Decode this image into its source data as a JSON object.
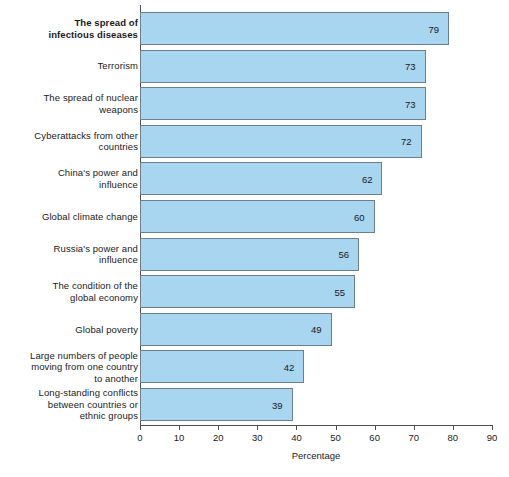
{
  "chart_data": {
    "type": "bar",
    "orientation": "horizontal",
    "title": "",
    "xlabel": "Percentage",
    "ylabel": "",
    "xlim": [
      0,
      90
    ],
    "xticks": [
      0,
      10,
      20,
      30,
      40,
      50,
      60,
      70,
      80,
      90
    ],
    "grid": false,
    "legend": null,
    "bar_fill_color": "#a8d5ef",
    "bar_border_color": "#6e7f8c",
    "categories": [
      "The spread of infectious diseases",
      "Terrorism",
      "The spread of nuclear weapons",
      "Cyberattacks from other countries",
      "China's power and influence",
      "Global climate change",
      "Russia's power and influence",
      "The condition of the global economy",
      "Global poverty",
      "Large numbers of people moving from one country to another",
      "Long-standing conflicts between countries or ethnic groups"
    ],
    "values": [
      79,
      73,
      73,
      72,
      62,
      60,
      56,
      55,
      49,
      42,
      39
    ],
    "bars": [
      {
        "label_lines": [
          "The spread of",
          "infectious diseases"
        ],
        "value": 79,
        "emphasis": true
      },
      {
        "label_lines": [
          "Terrorism"
        ],
        "value": 73,
        "emphasis": false
      },
      {
        "label_lines": [
          "The spread of nuclear",
          "weapons"
        ],
        "value": 73,
        "emphasis": false
      },
      {
        "label_lines": [
          "Cyberattacks from other",
          "countries"
        ],
        "value": 72,
        "emphasis": false
      },
      {
        "label_lines": [
          "China's power and",
          "influence"
        ],
        "value": 62,
        "emphasis": false
      },
      {
        "label_lines": [
          "Global climate change"
        ],
        "value": 60,
        "emphasis": false
      },
      {
        "label_lines": [
          "Russia's power and",
          "influence"
        ],
        "value": 56,
        "emphasis": false
      },
      {
        "label_lines": [
          "The condition of the",
          "global economy"
        ],
        "value": 55,
        "emphasis": false
      },
      {
        "label_lines": [
          "Global poverty"
        ],
        "value": 49,
        "emphasis": false
      },
      {
        "label_lines": [
          "Large numbers of people",
          "moving from one country",
          "to another"
        ],
        "value": 42,
        "emphasis": false
      },
      {
        "label_lines": [
          "Long-standing conflicts",
          "between countries or",
          "ethnic groups"
        ],
        "value": 39,
        "emphasis": false
      }
    ]
  }
}
